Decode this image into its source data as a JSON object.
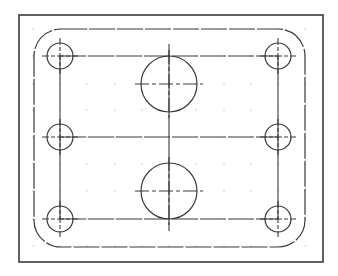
{
  "drawing": {
    "width": 338,
    "height": 276,
    "background": "#ffffff",
    "stroke_color": "#3a3a3a",
    "grid_color": "#9a9a9a",
    "frame": {
      "x": 19,
      "y": 15,
      "w": 304,
      "h": 247
    },
    "plate": {
      "x": 34,
      "y": 29,
      "w": 271,
      "h": 218,
      "corner_radius": 27
    },
    "grid": {
      "xs": [
        33,
        60,
        87,
        115,
        142,
        169,
        196,
        224,
        251,
        278,
        305
      ],
      "ys": [
        29,
        56,
        84,
        110,
        137,
        164,
        191,
        219,
        246
      ]
    },
    "bolt_row_lines_y": [
      56,
      137,
      219
    ],
    "bolt_col_lines_x": [
      60,
      278
    ],
    "center_line_x": 169,
    "small_holes": [
      {
        "name": "hole-top-left",
        "cx": 60,
        "cy": 56,
        "r": 13
      },
      {
        "name": "hole-mid-left",
        "cx": 60,
        "cy": 137,
        "r": 13
      },
      {
        "name": "hole-bottom-left",
        "cx": 60,
        "cy": 219,
        "r": 13
      },
      {
        "name": "hole-top-right",
        "cx": 278,
        "cy": 56,
        "r": 13
      },
      {
        "name": "hole-mid-right",
        "cx": 278,
        "cy": 137,
        "r": 13
      },
      {
        "name": "hole-bottom-right",
        "cx": 278,
        "cy": 219,
        "r": 13
      }
    ],
    "large_holes": [
      {
        "name": "bore-top",
        "cx": 169,
        "cy": 84,
        "r": 28
      },
      {
        "name": "bore-bottom",
        "cx": 169,
        "cy": 191,
        "r": 28
      }
    ]
  }
}
